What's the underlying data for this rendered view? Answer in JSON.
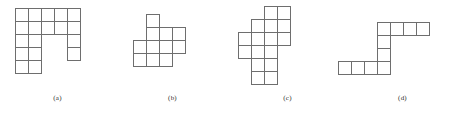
{
  "figure": {
    "cell_size": 13,
    "stroke_color": "#6e6e6e",
    "fill_color": "#ffffff",
    "background_color": "#ffffff",
    "panels": [
      {
        "id": "a",
        "caption": "(a)",
        "panel_left": 0,
        "origin_x": 15,
        "origin_y": 8,
        "grid_cols": 5,
        "grid_rows": 5,
        "cell_count": 15,
        "description": "U-shaped polyomino: full top row of five, left two columns extending down five rows, right column of three partial cells",
        "cells": [
          [
            0,
            0
          ],
          [
            1,
            0
          ],
          [
            2,
            0
          ],
          [
            3,
            0
          ],
          [
            4,
            0
          ],
          [
            0,
            1
          ],
          [
            1,
            1
          ],
          [
            2,
            1
          ],
          [
            3,
            1
          ],
          [
            4,
            1
          ],
          [
            0,
            2
          ],
          [
            1,
            2
          ],
          [
            4,
            2
          ],
          [
            0,
            3
          ],
          [
            1,
            3
          ],
          [
            4,
            3
          ],
          [
            0,
            4
          ],
          [
            1,
            4
          ]
        ]
      },
      {
        "id": "b",
        "caption": "(b)",
        "panel_left": 115,
        "origin_x": 18,
        "origin_y": 14,
        "grid_cols": 4,
        "grid_rows": 4,
        "cell_count": 10,
        "description": "Cross-like polyomino: single top cell, a middle band of three, a wide row of four and a lower row of three",
        "cells": [
          [
            1,
            0
          ],
          [
            1,
            1
          ],
          [
            2,
            1
          ],
          [
            3,
            1
          ],
          [
            0,
            2
          ],
          [
            1,
            2
          ],
          [
            2,
            2
          ],
          [
            3,
            2
          ],
          [
            0,
            3
          ],
          [
            1,
            3
          ],
          [
            2,
            3
          ]
        ]
      },
      {
        "id": "c",
        "caption": "(c)",
        "panel_left": 230,
        "origin_x": 8,
        "origin_y": 6,
        "grid_cols": 4,
        "grid_rows": 6,
        "cell_count": 12,
        "description": "Diagonal staircase polyomino descending from upper right to lower left",
        "cells": [
          [
            2,
            0
          ],
          [
            3,
            0
          ],
          [
            1,
            1
          ],
          [
            2,
            1
          ],
          [
            3,
            1
          ],
          [
            0,
            2
          ],
          [
            1,
            2
          ],
          [
            2,
            2
          ],
          [
            3,
            2
          ],
          [
            0,
            3
          ],
          [
            1,
            3
          ],
          [
            2,
            3
          ],
          [
            1,
            4
          ],
          [
            2,
            4
          ],
          [
            1,
            5
          ],
          [
            2,
            5
          ]
        ]
      },
      {
        "id": "d",
        "caption": "(d)",
        "panel_left": 345,
        "origin_x": -20,
        "origin_y": 22,
        "grid_cols": 8,
        "grid_rows": 4,
        "cell_count": 10,
        "description": "Z / S shaped polyomino: horizontal bar of four at top right, vertical connector, horizontal bar of four at lower left",
        "cells": [
          [
            4,
            0
          ],
          [
            5,
            0
          ],
          [
            6,
            0
          ],
          [
            7,
            0
          ],
          [
            4,
            1
          ],
          [
            4,
            2
          ],
          [
            1,
            3
          ],
          [
            2,
            3
          ],
          [
            3,
            3
          ],
          [
            4,
            3
          ]
        ]
      }
    ]
  }
}
